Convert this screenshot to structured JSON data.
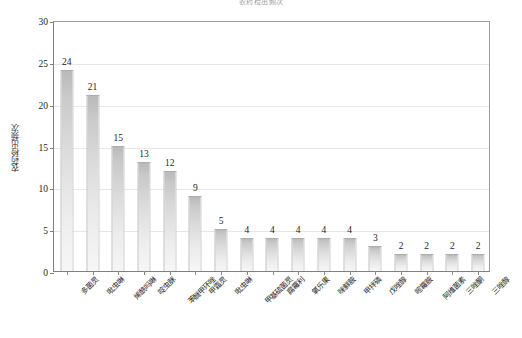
{
  "chart_data": {
    "type": "bar",
    "title": "农药检出频次",
    "xlabel": "",
    "ylabel": "农药检出频次",
    "ylim": [
      0,
      30
    ],
    "yticks": [
      0,
      5,
      10,
      15,
      20,
      25,
      30
    ],
    "grid": true,
    "legend": "none",
    "categories": [
      "多菌灵",
      "吡虫啉",
      "烯酰吗啉",
      "啶虫脒",
      "苯醚甲环唑",
      "甲霜灵",
      "吡虫啉",
      "甲基硫菌灵",
      "腐霉利",
      "氧乐果",
      "咪鲜胺",
      "甲拌磷",
      "戊唑醇",
      "嘧霉胺",
      "阿维菌素",
      "三唑酮",
      "三唑醇"
    ],
    "values": [
      24,
      21,
      15,
      13,
      12,
      9,
      5,
      4,
      4,
      4,
      4,
      4,
      3,
      2,
      2,
      2,
      2
    ],
    "colors": {
      "bar_top": "#b9b9b9",
      "bar_bottom": "#f6f6f6",
      "gridline": "#e6e6e6",
      "axis": "#808080",
      "text": "#1d1d1d"
    }
  }
}
